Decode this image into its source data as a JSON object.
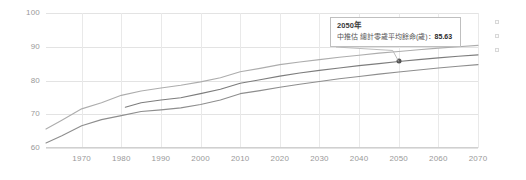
{
  "chart_data": {
    "type": "line",
    "title": "",
    "xlabel": "",
    "ylabel": "",
    "xlim": [
      1961,
      2070
    ],
    "ylim": [
      60,
      100
    ],
    "ytick_labels": [
      "100",
      "90",
      "80",
      "70",
      "60"
    ],
    "ytick_values": [
      100,
      90,
      80,
      70,
      60
    ],
    "xtick_labels": [
      "1970",
      "1980",
      "1990",
      "2000",
      "2010",
      "2020",
      "2030",
      "2040",
      "2050",
      "2060",
      "2070"
    ],
    "xtick_values": [
      1970,
      1980,
      1990,
      2000,
      2010,
      2020,
      2030,
      2040,
      2050,
      2060,
      2070
    ],
    "grid": true,
    "legend_position": "right",
    "series": [
      {
        "name": "female",
        "color": "#adadad",
        "x": [
          1961,
          1965,
          1970,
          1975,
          1980,
          1985,
          1990,
          1995,
          2000,
          2005,
          2010,
          2015,
          2020,
          2025,
          2030,
          2035,
          2040,
          2045,
          2050,
          2055,
          2060,
          2065,
          2070
        ],
        "values": [
          65.6,
          68.2,
          71.6,
          73.4,
          75.6,
          76.9,
          77.8,
          78.6,
          79.6,
          80.8,
          82.6,
          83.6,
          84.7,
          85.5,
          86.2,
          86.9,
          87.5,
          88.1,
          88.6,
          89.1,
          89.6,
          90.0,
          90.4
        ]
      },
      {
        "name": "total",
        "color": "#7d7d7d",
        "x": [
          1981,
          1985,
          1990,
          1995,
          2000,
          2005,
          2010,
          2015,
          2020,
          2025,
          2030,
          2035,
          2040,
          2045,
          2050,
          2055,
          2060,
          2065,
          2070
        ],
        "values": [
          72.1,
          73.4,
          74.2,
          74.9,
          76.1,
          77.4,
          79.2,
          80.2,
          81.3,
          82.2,
          83.0,
          83.7,
          84.4,
          85.0,
          85.63,
          86.2,
          86.7,
          87.2,
          87.6
        ]
      },
      {
        "name": "male",
        "color": "#8e8e8e",
        "x": [
          1961,
          1965,
          1970,
          1975,
          1980,
          1985,
          1990,
          1995,
          2000,
          2005,
          2010,
          2015,
          2020,
          2025,
          2030,
          2035,
          2040,
          2045,
          2050,
          2055,
          2060,
          2065,
          2070
        ],
        "values": [
          61.5,
          63.6,
          66.6,
          68.4,
          69.6,
          70.8,
          71.3,
          71.9,
          72.9,
          74.2,
          76.1,
          77.0,
          78.0,
          78.9,
          79.7,
          80.5,
          81.2,
          81.9,
          82.5,
          83.1,
          83.7,
          84.2,
          84.7
        ]
      }
    ],
    "highlight_point": {
      "x": 2050,
      "y": 85.63,
      "series": "total"
    }
  },
  "tooltip": {
    "title": "2050年",
    "label": "中推估 總計零歲平均餘命(歲)",
    "separator": "：",
    "value": "85.63"
  },
  "legend": {
    "markers": [
      "series-marker-1",
      "series-marker-2",
      "series-marker-3"
    ]
  }
}
